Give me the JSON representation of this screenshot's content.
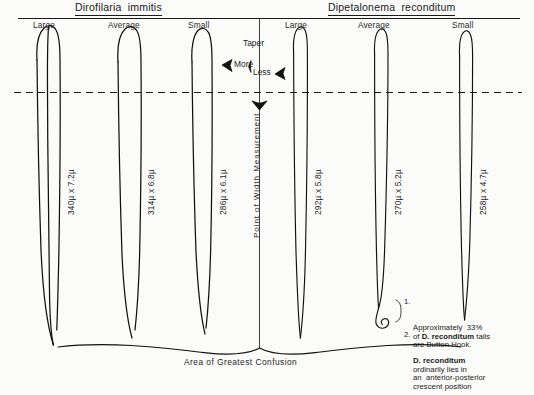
{
  "figure": {
    "caption": "Area of Greatest Confusion",
    "center_axis_label": "Point of Width Measurement",
    "background_color": "#fbfbf9",
    "ink_color": "#111111"
  },
  "groups": [
    {
      "title": "Dirofilaria  immitis",
      "specimens": [
        {
          "size_label": "Large",
          "measurement": "340µ x 7.2µ"
        },
        {
          "size_label": "Average",
          "measurement": "314µ x 6.8µ"
        },
        {
          "size_label": "Small",
          "measurement": "286µ x 6.1µ"
        }
      ]
    },
    {
      "title": "Dipetalonema  reconditum",
      "specimens": [
        {
          "size_label": "Large",
          "measurement": "292µ x 5.8µ"
        },
        {
          "size_label": "Average",
          "measurement": "270µ x 5.2µ"
        },
        {
          "size_label": "Small",
          "measurement": "258µ x 4.7µ"
        }
      ]
    }
  ],
  "taper": {
    "heading": "Taper",
    "more_label": "More",
    "less_label": "Less"
  },
  "notes": [
    {
      "number": "1.",
      "line1_pre": "Approximately  33%",
      "line2_pre": "of ",
      "line2_bold": "D. reconditum",
      "line2_post": " tails",
      "line3": "are Button Hook."
    },
    {
      "number": "2.",
      "line1_bold": "D. reconditum",
      "line2": "ordinarily lies in",
      "line3": "an  anterior-posterior",
      "line4": "crescent position"
    }
  ]
}
